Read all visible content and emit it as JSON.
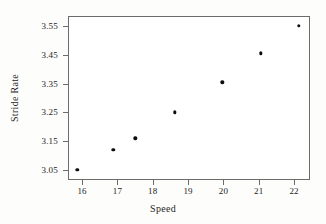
{
  "chart_data": {
    "type": "scatter",
    "title": "",
    "xlabel": "Speed",
    "ylabel": "Stride Rate",
    "xlim": [
      15.6,
      22.45
    ],
    "ylim": [
      3.015,
      3.585
    ],
    "xticks": [
      "16",
      "17",
      "18",
      "19",
      "20",
      "21",
      "22"
    ],
    "xtick_values": [
      16,
      17,
      18,
      19,
      20,
      21,
      22
    ],
    "yticks": [
      "3.05",
      "3.15",
      "3.25",
      "3.35",
      "3.45",
      "3.55"
    ],
    "ytick_values": [
      3.05,
      3.15,
      3.25,
      3.35,
      3.45,
      3.55
    ],
    "grid": false,
    "legend": null,
    "x": [
      15.86,
      16.88,
      17.5,
      18.62,
      19.97,
      21.06,
      22.13
    ],
    "y": [
      3.05,
      3.12,
      3.16,
      3.25,
      3.355,
      3.455,
      3.55
    ],
    "points": [
      {
        "x": 15.86,
        "y": 3.05
      },
      {
        "x": 16.88,
        "y": 3.12
      },
      {
        "x": 17.5,
        "y": 3.16
      },
      {
        "x": 18.62,
        "y": 3.25
      },
      {
        "x": 19.97,
        "y": 3.355
      },
      {
        "x": 21.06,
        "y": 3.455
      },
      {
        "x": 22.13,
        "y": 3.55
      }
    ],
    "marker_color": "#0d0d0d",
    "frame_color": "#6b6b6b",
    "background_color": "#ffffff"
  }
}
